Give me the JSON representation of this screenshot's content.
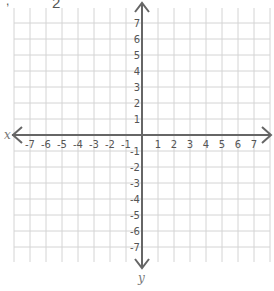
{
  "fragment_text": "2",
  "grid": {
    "x_min": -7,
    "x_max": 7,
    "y_min": -7,
    "y_max": 7,
    "origin_px": [
      142,
      135
    ],
    "spacing_px": 16,
    "grid_color": "#d4d4d4",
    "axis_color": "#666666",
    "label_color": "#555555"
  },
  "axes": {
    "x_label": "x",
    "y_label": "y",
    "x_ticks": [
      "-7",
      "-6",
      "-5",
      "-4",
      "-3",
      "-2",
      "-1",
      "1",
      "2",
      "3",
      "4",
      "5",
      "6",
      "7"
    ],
    "y_ticks": [
      "7",
      "6",
      "5",
      "4",
      "3",
      "2",
      "1",
      "-1",
      "-2",
      "-3",
      "-4",
      "-5",
      "-6",
      "-7"
    ]
  }
}
